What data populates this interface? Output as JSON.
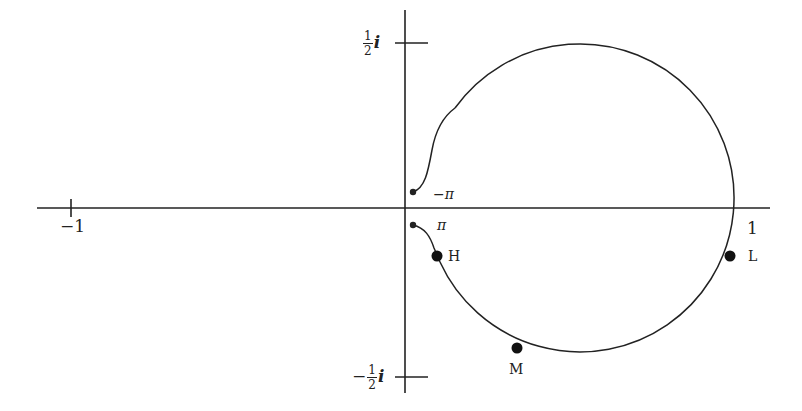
{
  "diagram": {
    "type": "nyquist-plot",
    "colors": {
      "stroke": "#222222",
      "background": "#ffffff"
    },
    "axes": {
      "real_axis": {
        "x_start": 37,
        "x_end": 770,
        "y": 208
      },
      "imag_axis": {
        "x": 405,
        "y_start": 10,
        "y_end": 393
      },
      "ticks": {
        "real": [
          {
            "value": -1,
            "label": "−1",
            "x": 71
          },
          {
            "value": 1,
            "label": "1",
            "x": 739
          }
        ],
        "imag": [
          {
            "value": 0.5,
            "label_num": "1",
            "label_den": "2",
            "label_prefix": "",
            "label_suffix": "i",
            "y": 43
          },
          {
            "value": -0.5,
            "label_num": "1",
            "label_den": "2",
            "label_prefix": "−",
            "label_suffix": "i",
            "y": 377
          }
        ]
      }
    },
    "curve": {
      "circle_center": [
        585,
        208
      ],
      "circle_radius": 154
    },
    "points": [
      {
        "name": "start-minus-pi",
        "label": "−π",
        "x": 413,
        "y": 192
      },
      {
        "name": "start-pi",
        "label": "π",
        "x": 413,
        "y": 225
      },
      {
        "name": "H",
        "label": "H",
        "x": 437,
        "y": 256
      },
      {
        "name": "M",
        "label": "M",
        "x": 517,
        "y": 348
      },
      {
        "name": "L",
        "label": "L",
        "x": 730,
        "y": 256
      }
    ]
  }
}
